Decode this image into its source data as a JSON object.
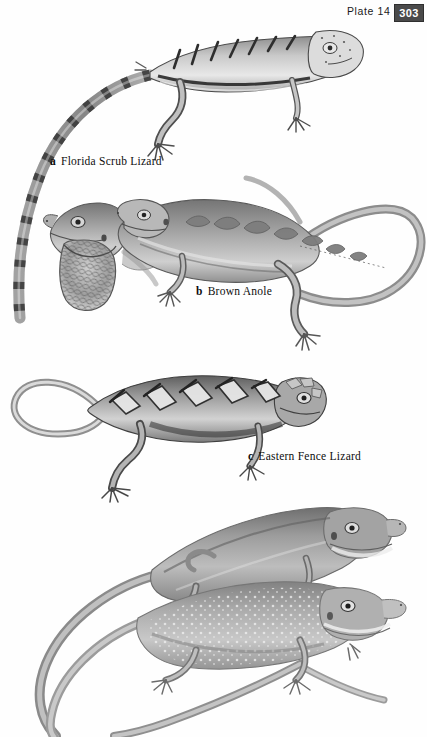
{
  "page": {
    "plate_label": "Plate 14",
    "page_number": "303",
    "background_color": "#fefefe",
    "page_number_box_color": "#4a4a4a",
    "page_number_text_color": "#ffffff"
  },
  "captions": [
    {
      "letter": "a",
      "name": "Florida Scrub Lizard"
    },
    {
      "letter": "b",
      "name": "Brown Anole"
    },
    {
      "letter": "c",
      "name": "Eastern Fence Lizard"
    }
  ],
  "figures": [
    {
      "id": "florida-scrub-lizard",
      "label": "a",
      "description": "Spiny lizard in left profile with long banded tail curving down the left margin",
      "ink": "#4f4f4f"
    },
    {
      "id": "brown-anole-dewlap",
      "label": "b",
      "description": "Brown Anole head with extended scaled throat dewlap",
      "ink": "#6a6a6a"
    },
    {
      "id": "brown-anole-body",
      "label": "b",
      "description": "Brown Anole full body with scalloped dorsal markings and long looping tail",
      "ink": "#6a6a6a"
    },
    {
      "id": "eastern-fence-lizard",
      "label": "c",
      "description": "Eastern Fence Lizard with chevron crossbands and looped tail",
      "ink": "#4a4a4a"
    },
    {
      "id": "green-anole-upper",
      "label": "",
      "description": "Smooth plain-backed anole, upper of bottom pair",
      "ink": "#7a7a7a"
    },
    {
      "id": "green-anole-lower",
      "label": "",
      "description": "Speckled anole with pale flecks, lower of bottom pair, tails crossing",
      "ink": "#8a8a8a"
    }
  ]
}
